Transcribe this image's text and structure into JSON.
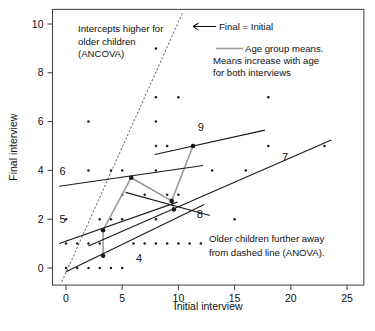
{
  "chart_data": {
    "type": "scatter",
    "title": "",
    "xlabel": "Initial interview",
    "ylabel": "Final interview",
    "xlim": [
      -1.2,
      26.5
    ],
    "ylim": [
      -0.7,
      10.6
    ],
    "xticks": [
      0,
      5,
      10,
      15,
      20,
      25
    ],
    "yticks": [
      0,
      2,
      4,
      6,
      8,
      10
    ],
    "grid": false,
    "legend_position": "top-right",
    "points": [
      [
        0,
        0
      ],
      [
        0,
        1
      ],
      [
        0,
        2
      ],
      [
        1,
        0
      ],
      [
        1,
        1
      ],
      [
        2,
        0
      ],
      [
        2,
        1
      ],
      [
        2,
        4
      ],
      [
        2,
        6
      ],
      [
        3,
        0
      ],
      [
        3,
        1
      ],
      [
        3,
        2
      ],
      [
        4,
        0
      ],
      [
        4,
        2
      ],
      [
        4,
        4
      ],
      [
        5,
        0
      ],
      [
        5,
        2
      ],
      [
        5,
        3
      ],
      [
        5,
        4
      ],
      [
        6,
        1
      ],
      [
        7,
        1
      ],
      [
        7,
        3
      ],
      [
        8,
        1
      ],
      [
        8,
        2
      ],
      [
        8,
        4
      ],
      [
        8,
        5
      ],
      [
        8,
        6
      ],
      [
        8,
        7
      ],
      [
        8,
        9
      ],
      [
        9,
        1
      ],
      [
        9,
        3
      ],
      [
        9,
        5
      ],
      [
        10,
        1
      ],
      [
        10,
        3
      ],
      [
        10,
        7
      ],
      [
        11,
        1
      ],
      [
        12,
        1
      ],
      [
        13,
        4
      ],
      [
        15,
        2
      ],
      [
        16,
        4
      ],
      [
        18,
        5
      ],
      [
        18,
        7
      ],
      [
        23,
        5
      ]
    ],
    "group_means": [
      {
        "age": 4,
        "x": 3.3,
        "y": 0.5
      },
      {
        "age": 5,
        "x": 3.3,
        "y": 1.55
      },
      {
        "age": 6,
        "x": 5.8,
        "y": 3.7
      },
      {
        "age": 7,
        "x": 9.6,
        "y": 2.4
      },
      {
        "age": 8,
        "x": 9.4,
        "y": 2.75
      },
      {
        "age": 9,
        "x": 11.3,
        "y": 5.0
      }
    ],
    "mean_connector_color": "#9a9a9a",
    "mean_connector_path": [
      [
        3.3,
        0.5
      ],
      [
        3.3,
        1.55
      ],
      [
        5.8,
        3.7
      ],
      [
        9.4,
        2.75
      ],
      [
        11.3,
        5.0
      ]
    ],
    "regression_lines": [
      {
        "age": 4,
        "x0": 0.0,
        "y0": -0.15,
        "x1": 12.3,
        "y1": 2.6,
        "label_x": 6.5,
        "label_y": 0.25
      },
      {
        "age": 5,
        "x0": -0.6,
        "y0": 1.0,
        "x1": 9.9,
        "y1": 2.7,
        "label_x": -0.3,
        "label_y": 1.85
      },
      {
        "age": 6,
        "x0": -0.6,
        "y0": 3.35,
        "x1": 12.2,
        "y1": 4.2,
        "label_x": -0.3,
        "label_y": 3.8
      },
      {
        "age": 7,
        "x0": 2.0,
        "y0": 0.9,
        "x1": 23.6,
        "y1": 5.25,
        "label_x": 19.5,
        "label_y": 4.4
      },
      {
        "age": 8,
        "x0": 5.3,
        "y0": 3.1,
        "x1": 12.8,
        "y1": 2.15,
        "label_x": 11.9,
        "label_y": 2.05
      },
      {
        "age": 9,
        "x0": 7.9,
        "y0": 4.65,
        "x1": 17.7,
        "y1": 5.65,
        "label_x": 12.0,
        "label_y": 5.6
      }
    ],
    "identity_line": {
      "label": "Final = Initial",
      "x0": -0.35,
      "y0": -0.55,
      "x1": 10.4,
      "y1": 10.5,
      "style": "dotted"
    },
    "annotations": [
      {
        "name": "intercept-note",
        "lines": [
          "Intercepts higher for",
          "older children",
          "(ANCOVA)"
        ]
      },
      {
        "name": "identity-label",
        "lines": [
          "Final = Initial"
        ]
      },
      {
        "name": "means-note",
        "lines": [
          "Age group means.",
          "Means increase with age",
          "for both interviews"
        ]
      },
      {
        "name": "anova-note",
        "lines": [
          "Older children further away",
          "from dashed line (ANOVA)."
        ]
      }
    ]
  },
  "axes": {
    "x_label": "Initial interview",
    "y_label": "Final interview",
    "x_tick_labels": [
      "0",
      "5",
      "10",
      "15",
      "20",
      "25"
    ],
    "y_tick_labels": [
      "0",
      "2",
      "4",
      "6",
      "8",
      "10"
    ]
  },
  "labels": {
    "group_4": "4",
    "group_5": "5",
    "group_6": "6",
    "group_7": "7",
    "group_8": "8",
    "group_9": "9"
  },
  "annotations": {
    "intercept_line_1": "Intercepts higher for",
    "intercept_line_2": "older children",
    "intercept_line_3": "(ANCOVA)",
    "identity_label": "Final = Initial",
    "means_line_1": "Age group means.",
    "means_line_2": "Means increase with age",
    "means_line_3": "for both interviews",
    "anova_line_1": "Older children further away",
    "anova_line_2": "from dashed line (ANOVA)."
  },
  "colors": {
    "axis": "#3a3a3a",
    "point": "#1a1a1a",
    "regression": "#1a1a1a",
    "mean_connector": "#9a9a9a",
    "identity": "#7a7a7a",
    "text": "#111111"
  }
}
